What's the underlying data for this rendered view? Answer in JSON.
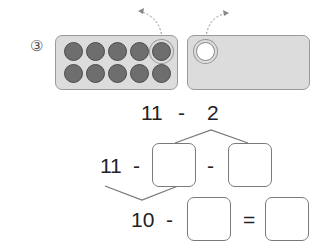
{
  "problem": {
    "number_label": "③",
    "left_tray": {
      "balls": 10,
      "rows": 2,
      "cols": 5,
      "ball_color": "#6e6e6e"
    },
    "right_tray": {
      "balls": 1,
      "ball_color": "#ffffff"
    },
    "expression": {
      "left": "11",
      "op": "-",
      "right": "2"
    },
    "step1": {
      "left": "11",
      "op1": "-",
      "op2": "-"
    },
    "step2": {
      "left": "10",
      "op": "-",
      "eq": "="
    }
  }
}
